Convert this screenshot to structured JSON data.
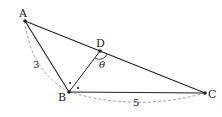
{
  "diagram": {
    "points": {
      "A": {
        "label": "A",
        "x": 25,
        "y": 21
      },
      "B": {
        "label": "B",
        "x": 69,
        "y": 92
      },
      "C": {
        "label": "C",
        "x": 205,
        "y": 93
      },
      "D": {
        "label": "D",
        "x": 100,
        "y": 51
      }
    },
    "segments": [
      [
        "A",
        "C"
      ],
      [
        "A",
        "B"
      ],
      [
        "B",
        "C"
      ],
      [
        "B",
        "D"
      ]
    ],
    "side_labels": {
      "AB": "3",
      "BC": "5"
    },
    "angle_label": "θ",
    "colors": {
      "line": "#222222",
      "dashed": "#999999",
      "text": "#222222"
    }
  }
}
